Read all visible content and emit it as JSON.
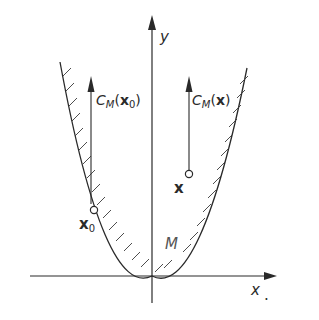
{
  "figure": {
    "axes": {
      "x_label": "x",
      "x_label_suffix": ".",
      "y_label": "y"
    },
    "curve": {
      "label": "M",
      "shape": "parabola",
      "hatching": "outside (admissible set boundary)"
    },
    "points": [
      {
        "id": "x0",
        "label_main": "x",
        "label_sub": "0",
        "cone_label_prefix": "C",
        "cone_label_sub": "M",
        "cone_label_arg": "x",
        "cone_label_arg_sub": "0"
      },
      {
        "id": "x",
        "label_main": "x",
        "cone_label_prefix": "C",
        "cone_label_sub": "M",
        "cone_label_arg": "x"
      }
    ],
    "colors": {
      "ink": "#2a2a2a",
      "background": "#ffffff"
    }
  }
}
